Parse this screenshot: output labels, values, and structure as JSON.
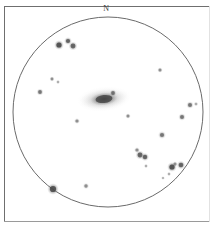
{
  "plate": {
    "width": 213,
    "height": 233,
    "background_color": "#ffffff",
    "frame_color": "#6f6f6f",
    "ink_color": "#4a4a4a"
  },
  "orientation": {
    "top_label": "N"
  },
  "field": {
    "shape": "circle",
    "center_x": 108,
    "center_y": 112,
    "radius": 95,
    "outline_color": "#6a6a6a",
    "outline_width": 1
  },
  "chart_data": {
    "type": "scatter",
    "title": "",
    "xlabel": "",
    "ylabel": "",
    "grid": false,
    "legend": null,
    "annotations": [
      "N"
    ],
    "field_of_view": {
      "center_x": 108,
      "center_y": 112,
      "radius": 95
    },
    "galaxy": {
      "label": "galaxy",
      "x": 104,
      "y": 99,
      "major_axis": 48,
      "minor_axis": 20,
      "angle_deg": -6,
      "core_major": 17,
      "core_minor": 8,
      "core_opacity": 0.72,
      "halo_opacity": 0.26
    },
    "stars": [
      {
        "x": 59,
        "y": 45,
        "r": 2.6,
        "mag": 1
      },
      {
        "x": 68,
        "y": 41,
        "r": 2.1,
        "mag": 2
      },
      {
        "x": 73,
        "y": 46,
        "r": 2.4,
        "mag": 2
      },
      {
        "x": 52,
        "y": 79,
        "r": 1.4,
        "mag": 4
      },
      {
        "x": 58,
        "y": 82,
        "r": 1.2,
        "mag": 5
      },
      {
        "x": 40,
        "y": 92,
        "r": 1.9,
        "mag": 3
      },
      {
        "x": 160,
        "y": 70,
        "r": 1.5,
        "mag": 4
      },
      {
        "x": 113,
        "y": 93,
        "r": 1.9,
        "mag": 3
      },
      {
        "x": 128,
        "y": 116,
        "r": 1.5,
        "mag": 4
      },
      {
        "x": 190,
        "y": 105,
        "r": 2.0,
        "mag": 3
      },
      {
        "x": 196,
        "y": 104,
        "r": 1.3,
        "mag": 5
      },
      {
        "x": 182,
        "y": 117,
        "r": 2.0,
        "mag": 3
      },
      {
        "x": 77,
        "y": 121,
        "r": 1.6,
        "mag": 4
      },
      {
        "x": 162,
        "y": 135,
        "r": 2.1,
        "mag": 3
      },
      {
        "x": 137,
        "y": 150,
        "r": 1.6,
        "mag": 4
      },
      {
        "x": 140,
        "y": 155,
        "r": 2.4,
        "mag": 2
      },
      {
        "x": 145,
        "y": 157,
        "r": 2.2,
        "mag": 2
      },
      {
        "x": 175,
        "y": 164,
        "r": 1.5,
        "mag": 4
      },
      {
        "x": 172,
        "y": 167,
        "r": 2.6,
        "mag": 1
      },
      {
        "x": 181,
        "y": 165,
        "r": 2.3,
        "mag": 2
      },
      {
        "x": 146,
        "y": 166,
        "r": 1.2,
        "mag": 5
      },
      {
        "x": 169,
        "y": 174,
        "r": 1.2,
        "mag": 5
      },
      {
        "x": 163,
        "y": 178,
        "r": 1.1,
        "mag": 5
      },
      {
        "x": 53,
        "y": 189,
        "r": 3.1,
        "mag": 1
      },
      {
        "x": 86,
        "y": 186,
        "r": 1.7,
        "mag": 4
      }
    ]
  }
}
